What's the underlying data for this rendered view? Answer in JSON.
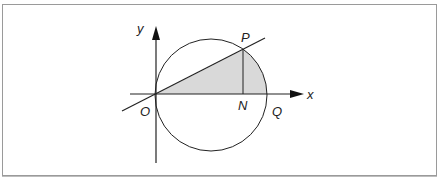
{
  "diagram": {
    "type": "geometry",
    "labels": {
      "y_axis": "y",
      "x_axis": "x",
      "origin": "O",
      "point_p": "P",
      "point_n": "N",
      "point_q": "Q"
    },
    "colors": {
      "stroke": "#222222",
      "shade": "#d9d9d9",
      "frame": "#9a9a9a"
    }
  }
}
